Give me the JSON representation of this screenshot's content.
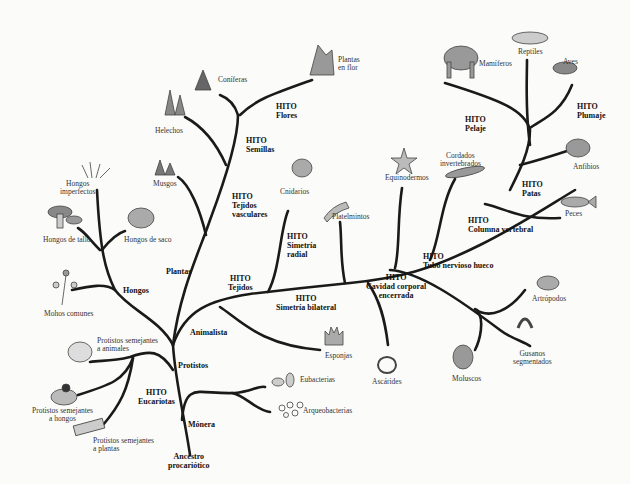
{
  "diagram": {
    "root": {
      "line1": "Ancestro",
      "line2": "procariótico"
    },
    "groups": {
      "monera": "Mónera",
      "protistos": "Protistos",
      "animalista": "Animalista",
      "hongos": "Hongos",
      "plantas": "Plantas"
    },
    "milestones": {
      "eucariotas": {
        "title": "HITO",
        "text": "Eucariotas"
      },
      "tejidos_vasculares": {
        "title": "HITO",
        "text1": "Tejidos",
        "text2": "vasculares"
      },
      "semillas": {
        "title": "HITO",
        "text": "Semillas"
      },
      "flores": {
        "title": "HITO",
        "text": "Flores"
      },
      "tejidos": {
        "title": "HITO",
        "text": "Tejidos"
      },
      "simetria_radial": {
        "title": "HITO",
        "text1": "Simetría",
        "text2": "radial"
      },
      "simetria_bilateral": {
        "title": "HITO",
        "text": "Simetría bilateral"
      },
      "cavidad_corporal": {
        "title": "HITO",
        "text1": "Cavidad corporal",
        "text2": "encerrada"
      },
      "tubo_nervioso": {
        "title": "HITO",
        "text": "Tubo nervioso hueco"
      },
      "columna_vertebral": {
        "title": "HITO",
        "text": "Columna vertebral"
      },
      "patas": {
        "title": "HITO",
        "text": "Patas"
      },
      "pelaje": {
        "title": "HITO",
        "text": "Pelaje"
      },
      "plumaje": {
        "title": "HITO",
        "text": "Plumaje"
      }
    },
    "taxa": {
      "eubacterias": "Eubacterias",
      "arqueobacterias": "Arqueobacterias",
      "protistos_animales": {
        "line1": "Protistos semejantes",
        "line2": "a animales"
      },
      "protistos_hongos": {
        "line1": "Protistos semejantes",
        "line2": "a hongos"
      },
      "protistos_plantas": {
        "line1": "Protistos semejantes",
        "line2": "a plantas"
      },
      "mohos_comunes": "Mohos comunes",
      "hongos_tallo": "Hongos de tallo",
      "hongos_saco": "Hongos de saco",
      "hongos_imperfectos": {
        "line1": "Hongos",
        "line2": "imperfectos"
      },
      "musgos": "Musgos",
      "helechos": "Helechos",
      "coniferas": "Coníferas",
      "plantas_flor": {
        "line1": "Plantas",
        "line2": "en flor"
      },
      "cnidarios": "Cnidarios",
      "esponjas": "Esponjas",
      "platelmintos": "Platelmintos",
      "ascarides": "Ascárides",
      "equinodermos": "Equinodermos",
      "moluscos": "Moluscos",
      "artropodos": "Artrópodos",
      "gusanos_segmentados": {
        "line1": "Gusanos",
        "line2": "segmentados"
      },
      "cordados_invertebrados": {
        "line1": "Cordados",
        "line2": "invertebrados"
      },
      "peces": "Peces",
      "anfibios": "Anfibios",
      "mamiferos": "Mamíferos",
      "reptiles": "Reptiles",
      "aves": "Aves"
    }
  }
}
